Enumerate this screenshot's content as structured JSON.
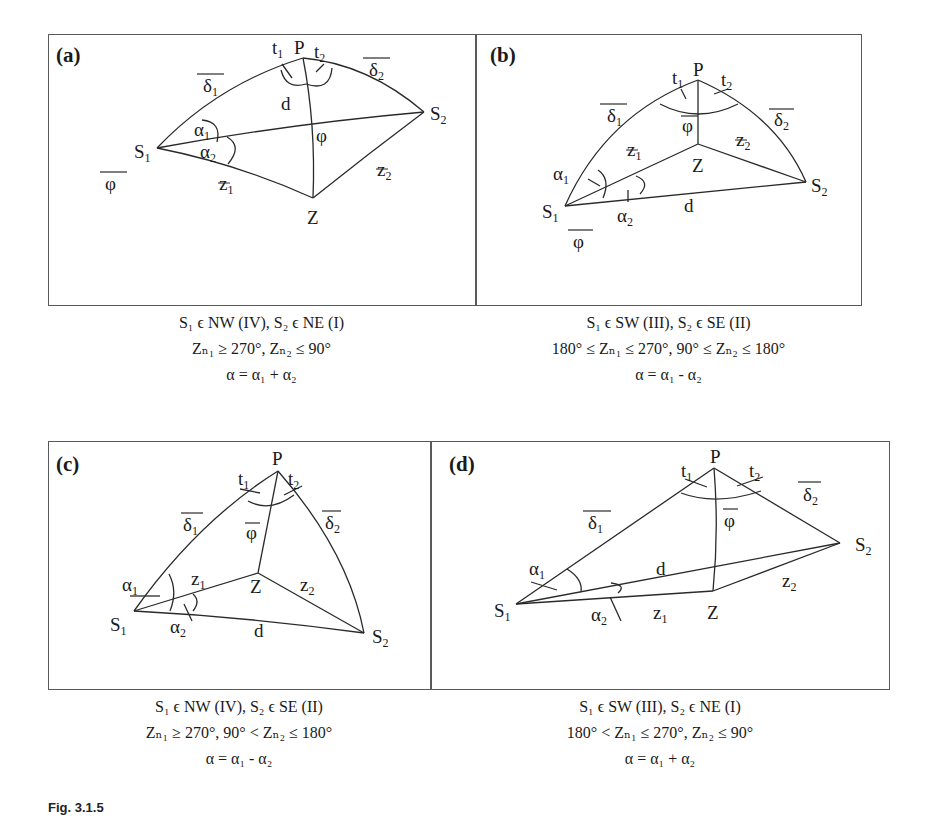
{
  "figure": {
    "label": "Fig. 3.1.5",
    "panels": [
      {
        "id": "a",
        "label": "(a)",
        "points": {
          "P": "P",
          "S1": "S",
          "S1_sub": "1",
          "S2": "S",
          "S2_sub": "2",
          "Z": "Z"
        },
        "arc_labels": {
          "delta1": "δ",
          "delta1_sub": "1",
          "delta2": "δ",
          "delta2_sub": "2",
          "d": "d",
          "phi": "φ",
          "phi_bar": "φ",
          "z1": "z",
          "z1_sub": "1",
          "z2": "z",
          "z2_sub": "2"
        },
        "angle_labels": {
          "t1": "t",
          "t1_sub": "1",
          "t2": "t",
          "t2_sub": "2",
          "alpha1": "α",
          "alpha1_sub": "1",
          "alpha2": "α",
          "alpha2_sub": "2"
        },
        "caption": {
          "line1": "S₁ ϵ NW (IV),  S₂ ϵ NE (I)",
          "line2": "Zₙ₁ ≥ 270°,   Zₙ₂ ≤ 90°",
          "line3": "α = α₁ + α₂"
        }
      },
      {
        "id": "b",
        "label": "(b)",
        "points": {
          "P": "P",
          "S1": "S",
          "S1_sub": "1",
          "S2": "S",
          "S2_sub": "2",
          "Z": "Z"
        },
        "arc_labels": {
          "delta1": "δ",
          "delta1_sub": "1",
          "delta2": "δ",
          "delta2_sub": "2",
          "d": "d",
          "phi": "φ",
          "phi_bar": "φ",
          "z1": "z",
          "z1_sub": "1",
          "z2": "z",
          "z2_sub": "2"
        },
        "angle_labels": {
          "t1": "t",
          "t1_sub": "1",
          "t2": "t",
          "t2_sub": "2",
          "alpha1": "α",
          "alpha1_sub": "1",
          "alpha2": "α",
          "alpha2_sub": "2"
        },
        "caption": {
          "line1": "S₁ ϵ SW (III),  S₂ ϵ SE (II)",
          "line2": "180° ≤ Zₙ₁ ≤ 270°,   90° ≤ Zₙ₂ ≤ 180°",
          "line3": "α = α₁ - α₂"
        }
      },
      {
        "id": "c",
        "label": "(c)",
        "points": {
          "P": "P",
          "S1": "S",
          "S1_sub": "1",
          "S2": "S",
          "S2_sub": "2",
          "Z": "Z"
        },
        "arc_labels": {
          "delta1": "δ",
          "delta1_sub": "1",
          "delta2": "δ",
          "delta2_sub": "2",
          "d": "d",
          "phi": "φ",
          "z1": "z",
          "z1_sub": "1",
          "z2": "z",
          "z2_sub": "2"
        },
        "angle_labels": {
          "t1": "t",
          "t1_sub": "1",
          "t2": "t",
          "t2_sub": "2",
          "alpha1": "α",
          "alpha1_sub": "1",
          "alpha2": "α",
          "alpha2_sub": "2"
        },
        "caption": {
          "line1": "S₁ ϵ NW (IV),  S₂ ϵ SE (II)",
          "line2": "Zₙ₁ ≥ 270°,  90° < Zₙ₂ ≤ 180°",
          "line3": "α = α₁ - α₂"
        }
      },
      {
        "id": "d",
        "label": "(d)",
        "points": {
          "P": "P",
          "S1": "S",
          "S1_sub": "1",
          "S2": "S",
          "S2_sub": "2",
          "Z": "Z"
        },
        "arc_labels": {
          "delta1": "δ",
          "delta1_sub": "1",
          "delta2": "δ",
          "delta2_sub": "2",
          "d": "d",
          "phi": "φ",
          "z1": "z",
          "z1_sub": "1",
          "z2": "z",
          "z2_sub": "2"
        },
        "angle_labels": {
          "t1": "t",
          "t1_sub": "1",
          "t2": "t",
          "t2_sub": "2",
          "alpha1": "α",
          "alpha1_sub": "1",
          "alpha2": "α",
          "alpha2_sub": "2"
        },
        "caption": {
          "line1": "S₁ ϵ SW (III),  S₂ ϵ NE (I)",
          "line2": "180° < Zₙ₁ ≤ 270°,   Zₙ₂ ≤  90°",
          "line3": "α = α₁ + α₂"
        }
      }
    ]
  },
  "colors": {
    "line": "#2a2a2a",
    "frame": "#5a5a5a",
    "text": "#1a1a1a",
    "background": "#ffffff"
  }
}
